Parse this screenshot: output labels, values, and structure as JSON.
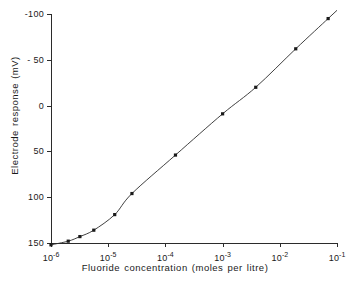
{
  "chart_data": {
    "type": "line",
    "title": "",
    "xlabel": "Fluoride concentration (moles per litre)",
    "ylabel": "Electrode response (mV)",
    "xscale": "log",
    "xlim": [
      1e-06,
      0.1
    ],
    "ylim": [
      150,
      -100
    ],
    "y_inverted": true,
    "grid": false,
    "legend": false,
    "xticks": [
      {
        "value": 1e-06,
        "label": "10",
        "exp": "-6"
      },
      {
        "value": 1e-05,
        "label": "10",
        "exp": "-5"
      },
      {
        "value": 0.0001,
        "label": "10",
        "exp": "-4"
      },
      {
        "value": 0.001,
        "label": "10",
        "exp": "-3"
      },
      {
        "value": 0.01,
        "label": "10",
        "exp": "-2"
      },
      {
        "value": 0.1,
        "label": "10",
        "exp": "-1"
      }
    ],
    "yticks": [
      {
        "value": -100,
        "label": "-100"
      },
      {
        "value": -50,
        "label": "- 50"
      },
      {
        "value": 0,
        "label": "0"
      },
      {
        "value": 50,
        "label": "50"
      },
      {
        "value": 100,
        "label": "100"
      },
      {
        "value": 150,
        "label": "150"
      }
    ],
    "series": [
      {
        "name": "Fluoride ion-selective electrode calibration",
        "marker": "square",
        "marker_color": "#1a1a1a",
        "line_color": "#2b2b2b",
        "points": [
          {
            "x": 1e-06,
            "y": 152
          },
          {
            "x": 2e-06,
            "y": 148
          },
          {
            "x": 3.2e-06,
            "y": 143
          },
          {
            "x": 5.6e-06,
            "y": 136
          },
          {
            "x": 1.3e-05,
            "y": 119
          },
          {
            "x": 2.6e-05,
            "y": 96
          },
          {
            "x": 0.00015,
            "y": 54
          },
          {
            "x": 0.001,
            "y": 9
          },
          {
            "x": 0.0038,
            "y": -20
          },
          {
            "x": 0.019,
            "y": -62
          },
          {
            "x": 0.07,
            "y": -95
          }
        ]
      }
    ],
    "annotations": []
  },
  "axis_titles": {
    "x": "Fluoride concentration (moles per litre)",
    "y": "Electrode response (mV)"
  }
}
